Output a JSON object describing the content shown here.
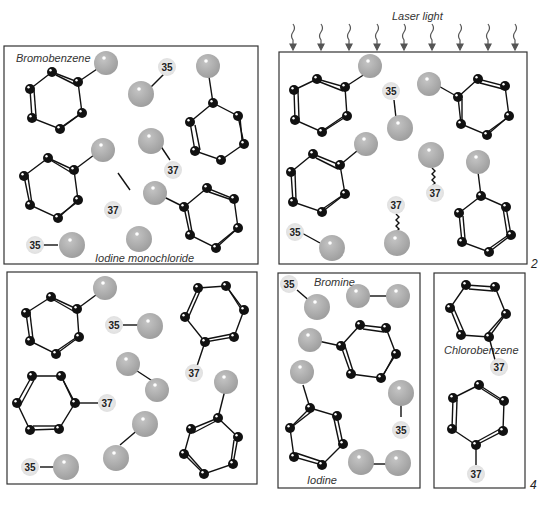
{
  "diagram": {
    "laser_label": "Laser light",
    "panels": [
      {
        "id": "1",
        "number_label": "",
        "labels": [
          "Bromobenzene",
          "Iodine monochloride"
        ]
      },
      {
        "id": "2",
        "number_label": "2",
        "labels": []
      },
      {
        "id": "3",
        "number_label": "",
        "labels": []
      },
      {
        "id": "4a",
        "number_label": "",
        "labels": [
          "Bromine",
          "Iodine"
        ]
      },
      {
        "id": "4b",
        "number_label": "4",
        "labels": [
          "Chlorobenzene"
        ]
      }
    ],
    "isotopes": {
      "light": "35",
      "heavy": "37"
    },
    "colors": {
      "carbon": "#111111",
      "halogen_light": "#b5b5b5",
      "halogen_dark": "#9a9a9a",
      "chlorine": "#e6e6e6",
      "border": "#333333"
    }
  }
}
